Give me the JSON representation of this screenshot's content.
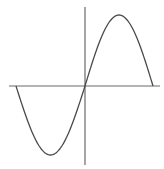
{
  "diagram": {
    "type": "sine-wave",
    "colors": {
      "axis": "#6a6a6a",
      "curve": "#4a4a4a",
      "background": "#ffffff"
    },
    "axes": {
      "x_axis": {
        "x1": 9,
        "x2": 160,
        "y": 86
      },
      "y_axis": {
        "x": 85,
        "y1": 7,
        "y2": 165
      }
    },
    "curve": {
      "start": [
        16,
        86
      ],
      "minimum": [
        51,
        155
      ],
      "origin": [
        85,
        86
      ],
      "maximum": [
        120,
        15
      ],
      "end": [
        153,
        86
      ]
    }
  }
}
